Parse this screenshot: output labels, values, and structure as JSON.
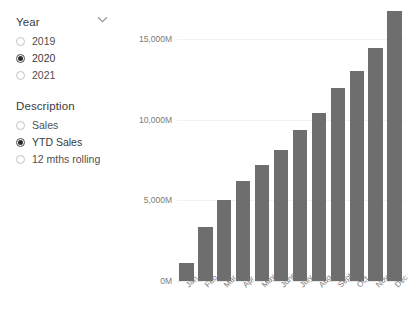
{
  "slicers": [
    {
      "name": "year",
      "title": "Year",
      "icon": "chevron-down-icon",
      "options": [
        {
          "label": "2019",
          "selected": false
        },
        {
          "label": "2020",
          "selected": true
        },
        {
          "label": "2021",
          "selected": false
        }
      ]
    },
    {
      "name": "description",
      "title": "Description",
      "options": [
        {
          "label": "Sales",
          "selected": false
        },
        {
          "label": "YTD Sales",
          "selected": true
        },
        {
          "label": "12 mths rolling",
          "selected": false
        }
      ]
    }
  ],
  "chart_data": {
    "type": "bar",
    "title": "",
    "xlabel": "",
    "ylabel": "",
    "categories": [
      "Jan",
      "Feb",
      "Mar",
      "Apr",
      "May",
      "June",
      "July",
      "Aug",
      "Sept",
      "Oct",
      "Nov",
      "Dec"
    ],
    "values": [
      1100,
      3350,
      5000,
      6200,
      7200,
      8100,
      9350,
      10400,
      11950,
      13000,
      14450,
      16750
    ],
    "ylim": [
      0,
      17500
    ],
    "ytick_values": [
      0,
      5000,
      10000,
      15000
    ],
    "ytick_labels": [
      "0M",
      "5,000M",
      "10,000M",
      "15,000M"
    ],
    "grid": true,
    "legend": "none",
    "bar_color": "#6e6e6e",
    "units": "M"
  }
}
